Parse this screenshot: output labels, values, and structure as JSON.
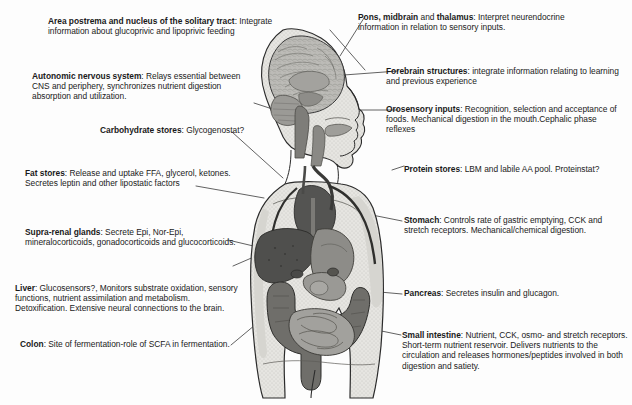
{
  "background_color": "#fdfdfd",
  "text_color": "#1a1a1a",
  "line_color": "#3a3a3a",
  "figure": {
    "name": "human-body-anatomy-diagram",
    "palette": {
      "body_outline": "#2b2b2b",
      "skin_fill": "#e9e8e4",
      "body_shade": "#d8d7d2",
      "brain_fill": "#b9b8b4",
      "organ_dark": "#5a5a5a",
      "organ_mid": "#8c8c8c",
      "organ_light": "#b2b2b2"
    }
  },
  "callouts": {
    "left": [
      {
        "id": "area-postrema",
        "term": "Area postrema and nucleus of the solitary tract",
        "body": ": Integrate information about glucoprivic and lipoprivic feeding"
      },
      {
        "id": "autonomic-nervous-system",
        "term": "Autonomic nervous system",
        "body": ": Relays essential between CNS and periphery, synchronizes nutrient  digestion absorption and utilization."
      },
      {
        "id": "carbohydrate-stores",
        "term": "Carbohydrate stores",
        "body": ": Glycogenostat?"
      },
      {
        "id": "fat-stores",
        "term": "Fat stores",
        "body": ": Release and uptake FFA, glycerol, ketones. Secretes leptin and other lipostatic factors"
      },
      {
        "id": "supra-renal-glands",
        "term": "Supra-renal glands",
        "body": ": Secrete Epi, Nor-Epi, mineralocorticoids, gonadocorticoids and glucocorticoids."
      },
      {
        "id": "liver",
        "term": "Liver",
        "body": ": Glucosensors?, Monitors substrate oxidation, sensory functions, nutrient assimilation and metabolism. Detoxification. Extensive neural connections to the brain."
      },
      {
        "id": "colon",
        "term": "Colon",
        "body": ": Site of fermentation-role of SCFA in fermentation."
      }
    ],
    "right": [
      {
        "id": "pons-midbrain-thalamus",
        "term": "Pons, midbrain",
        "term2": " and ",
        "term3": "thalamus",
        "body": ": Interpret neurendocrine information in relation to sensory inputs."
      },
      {
        "id": "forebrain-structures",
        "term": "Forebrain structures",
        "body": ": integrate information relating to learning and previous experience"
      },
      {
        "id": "orosensory-inputs",
        "term": "Orosensory inputs",
        "body": ": Recognition, selection and acceptance of foods. Mechanical digestion in the mouth.Cephalic phase reflexes"
      },
      {
        "id": "protein-stores",
        "term": "Protein stores",
        "body": ": LBM and labile AA pool. Proteinstat?"
      },
      {
        "id": "stomach",
        "term": "Stomach",
        "body": ": Controls rate of gastric emptying, CCK and stretch receptors. Mechanical/chemical digestion."
      },
      {
        "id": "pancreas",
        "term": "Pancreas",
        "body": ": Secretes insulin and glucagon."
      },
      {
        "id": "small-intestine",
        "term": "Small intestine",
        "body": ": Nutrient, CCK, osmo- and stretch receptors.  Short-term nutrient reservoir. Delivers nutrients to the circulation and releases hormones/peptides involved in both digestion and satiety."
      }
    ]
  }
}
